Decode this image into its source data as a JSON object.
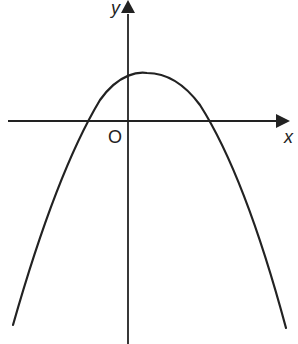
{
  "diagram": {
    "type": "parabola-graph",
    "labels": {
      "y_axis": "y",
      "x_axis": "x",
      "origin": "O"
    },
    "colors": {
      "stroke": "#222222",
      "background": "#ffffff"
    }
  }
}
